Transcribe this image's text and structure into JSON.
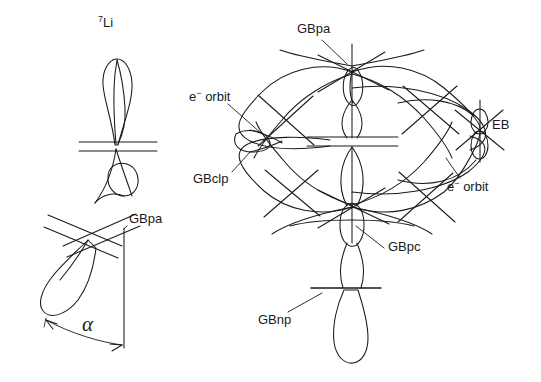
{
  "figure": {
    "kind": "orbital-structure-diagram",
    "background_color": "#ffffff",
    "stroke_color": "#1a1a1a",
    "width": 541,
    "height": 382
  },
  "labels": {
    "li7_isotope_mass": "7",
    "li7_element": "Li",
    "left_gbpa": "GBpa",
    "alpha_angle": "α",
    "right_gbpa": "GBpa",
    "e_orbit_left_symbol": "e",
    "e_orbit_left_charge": "−",
    "e_orbit_left_word": "orbit",
    "gbclp": "GBclp",
    "eb": "EB",
    "e_orbit_right_symbol": "e",
    "e_orbit_right_charge": "−",
    "e_orbit_right_word": "orbit",
    "gbpc": "GBpc",
    "gbnp": "GBnp"
  },
  "label_positions": {
    "li7": {
      "x": 98,
      "y": 18
    },
    "left_gbpa": {
      "x": 129,
      "y": 218
    },
    "alpha": {
      "x": 82,
      "y": 324
    },
    "right_gbpa": {
      "x": 297,
      "y": 27
    },
    "e_orbit_left": {
      "x": 189,
      "y": 95
    },
    "gbclp": {
      "x": 193,
      "y": 177
    },
    "eb": {
      "x": 492,
      "y": 122
    },
    "e_orbit_right": {
      "x": 447,
      "y": 184
    },
    "gbpc": {
      "x": 388,
      "y": 245
    },
    "gbnp": {
      "x": 258,
      "y": 318
    }
  },
  "structures": {
    "left": {
      "name": "Li-7 two-lobe orbital structure",
      "upper_lobe_direction": "vertical-up",
      "lower_lobe_direction": "tilted-down-left",
      "node_lines_upper": 2,
      "node_lines_lower": 2,
      "angle_marker": "alpha",
      "reference_axis": "vertical GBpa line"
    },
    "right": {
      "name": "cluster of overlapping orbital nodes",
      "node_count": 9,
      "has_central_node_lines": true,
      "bottom_lobe_direction": "vertical-down",
      "top_lobe_direction": "vertical-up"
    }
  }
}
